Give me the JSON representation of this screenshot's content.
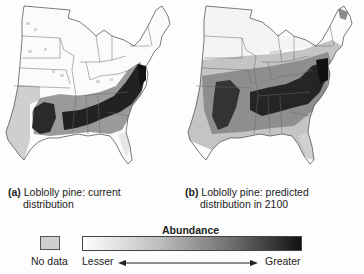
{
  "figure": {
    "panels": [
      {
        "id": "a",
        "label": "(a)",
        "caption_line1": "Loblolly pine: current",
        "caption_line2": "distribution",
        "description": "Current abundance concentrated in Southeast US (Carolinas, Georgia, Alabama, Mississippi, Louisiana, east Texas)"
      },
      {
        "id": "b",
        "label": "(b)",
        "caption_line1": "Loblolly pine: predicted",
        "caption_line2": "distribution in 2100",
        "description": "Predicted abundance shifts north and spreads across Mid-Atlantic, Ohio Valley and southern Midwest"
      }
    ],
    "legend": {
      "title": "Abundance",
      "no_data_label": "No data",
      "scale_min_label": "Lesser",
      "scale_max_label": "Greater",
      "colors": {
        "no_data": "#cfcfcf",
        "min": "#ffffff",
        "max": "#111111"
      }
    }
  }
}
